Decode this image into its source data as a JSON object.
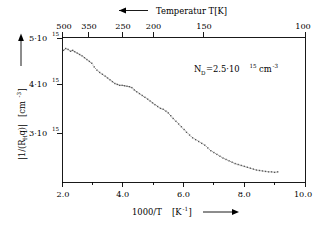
{
  "chart_data": {
    "type": "scatter",
    "title": "",
    "xlabel": "1000/T [K^-1]",
    "ylabel": "|1/(R_H q)| [cm^-3]",
    "xlim": [
      2.0,
      10.0
    ],
    "ylim": [
      2000000000000000.0,
      5150000000000000.0
    ],
    "grid": false,
    "legend": null,
    "x": [
      2.05,
      2.12,
      2.2,
      2.28,
      2.35,
      2.42,
      2.5,
      2.58,
      2.66,
      2.74,
      2.82,
      2.9,
      2.98,
      3.06,
      3.15,
      3.24,
      3.33,
      3.42,
      3.5,
      3.58,
      3.66,
      3.74,
      3.82,
      3.9,
      3.98,
      4.06,
      4.14,
      4.22,
      4.3,
      4.38,
      4.46,
      4.55,
      4.64,
      4.73,
      4.82,
      4.9,
      4.98,
      5.06,
      5.15,
      5.24,
      5.33,
      5.42,
      5.5,
      5.58,
      5.66,
      5.75,
      5.84,
      5.93,
      6.02,
      6.1,
      6.2,
      6.3,
      6.4,
      6.5,
      6.6,
      6.7,
      6.8,
      6.9,
      7.0,
      7.1,
      7.2,
      7.3,
      7.4,
      7.5,
      7.6,
      7.7,
      7.8,
      7.9,
      8.0,
      8.1,
      8.2,
      8.3,
      8.4,
      8.5,
      8.6,
      8.7,
      8.8,
      8.9,
      9.0,
      9.1
    ],
    "y": [
      4860000000000000.0,
      4900000000000000.0,
      4880000000000000.0,
      4840000000000000.0,
      4860000000000000.0,
      4830000000000000.0,
      4800000000000000.0,
      4770000000000000.0,
      4740000000000000.0,
      4700000000000000.0,
      4660000000000000.0,
      4620000000000000.0,
      4580000000000000.0,
      4500000000000000.0,
      4430000000000000.0,
      4380000000000000.0,
      4340000000000000.0,
      4300000000000000.0,
      4260000000000000.0,
      4220000000000000.0,
      4180000000000000.0,
      4140000000000000.0,
      4120000000000000.0,
      4100000000000000.0,
      4100000000000000.0,
      4090000000000000.0,
      4080000000000000.0,
      4070000000000000.0,
      4050000000000000.0,
      4000000000000000.0,
      3960000000000000.0,
      3920000000000000.0,
      3880000000000000.0,
      3840000000000000.0,
      3800000000000000.0,
      3760000000000000.0,
      3720000000000000.0,
      3680000000000000.0,
      3640000000000000.0,
      3600000000000000.0,
      3580000000000000.0,
      3540000000000000.0,
      3500000000000000.0,
      3440000000000000.0,
      3380000000000000.0,
      3320000000000000.0,
      3260000000000000.0,
      3200000000000000.0,
      3140000000000000.0,
      3080000000000000.0,
      3020000000000000.0,
      2960000000000000.0,
      2920000000000000.0,
      2880000000000000.0,
      2840000000000000.0,
      2800000000000000.0,
      2740000000000000.0,
      2680000000000000.0,
      2640000000000000.0,
      2600000000000000.0,
      2560000000000000.0,
      2520000000000000.0,
      2490000000000000.0,
      2460000000000000.0,
      2430000000000000.0,
      2400000000000000.0,
      2380000000000000.0,
      2360000000000000.0,
      2340000000000000.0,
      2320000000000000.0,
      2300000000000000.0,
      2280000000000000.0,
      2260000000000000.0,
      2250000000000000.0,
      2240000000000000.0,
      2230000000000000.0,
      2220000000000000.0,
      2220000000000000.0,
      2210000000000000.0,
      2220000000000000.0
    ],
    "bottom_axis": {
      "label_main": "1000/T",
      "label_unit_open": "[K",
      "label_unit_exp": "-1",
      "label_unit_close": "]",
      "direction_arrow": "right-arrow",
      "ticks": [
        {
          "value": 2.0,
          "label": "2.0"
        },
        {
          "value": 4.0,
          "label": "4.0"
        },
        {
          "value": 6.0,
          "label": "6.0"
        },
        {
          "value": 8.0,
          "label": "8.0"
        },
        {
          "value": 10.0,
          "label": "10.0"
        }
      ],
      "minor_ticks": [
        3.0,
        5.0,
        7.0,
        9.0
      ]
    },
    "top_axis": {
      "title": "Temperatur  T[K]",
      "direction_arrow": "left-arrow",
      "ticks": [
        {
          "value": 2.0,
          "label": "500"
        },
        {
          "value": 2.857,
          "label": "350"
        },
        {
          "value": 4.0,
          "label": "250"
        },
        {
          "value": 5.0,
          "label": "200"
        },
        {
          "value": 6.667,
          "label": "150"
        },
        {
          "value": 10.0,
          "label": "100"
        }
      ]
    },
    "left_axis": {
      "label_abs": "|1/(R",
      "label_sub": "H",
      "label_abs2": "q)|",
      "label_unit_open": "[cm",
      "label_unit_exp": "-3",
      "label_unit_close": "]",
      "direction_arrow": "up-arrow",
      "ticks": [
        {
          "value": 5000000000000000.0,
          "mantissa": "5·10",
          "exponent": "15"
        },
        {
          "value": 4000000000000000.0,
          "mantissa": "4·10",
          "exponent": "15"
        },
        {
          "value": 3000000000000000.0,
          "mantissa": "3·10",
          "exponent": "15"
        }
      ]
    },
    "annotation": {
      "symbol": "N",
      "subscript": "D",
      "equals_value": "=2.5·10",
      "exponent": "15",
      "unit": "cm",
      "unit_exponent": "-3"
    }
  },
  "colors": {
    "axis": "#000000",
    "data_points": "#555555",
    "background": "#ffffff"
  }
}
